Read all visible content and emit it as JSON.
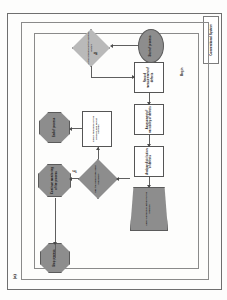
{
  "figure": {
    "caption": "(a)",
    "side_caption": "Conventional System",
    "begin_label": "Begin"
  },
  "flowchart": {
    "type": "process-flowchart",
    "orientation": "rotated-90-ccw",
    "nodes": [
      {
        "id": "start",
        "shape": "ellipse",
        "fill": "#8d8d8d",
        "label": "Start of process"
      },
      {
        "id": "decision-1",
        "shape": "diamond",
        "fill": "#b9b9b9",
        "label": "Is the process within control limits?"
      },
      {
        "id": "step-1",
        "shape": "rectangle",
        "fill": "#ffffff",
        "label": "Record measurement of defects"
      },
      {
        "id": "step-2",
        "shape": "rectangle",
        "fill": "#ffffff",
        "label": "Assessment of variability of defects"
      },
      {
        "id": "step-3",
        "shape": "rectangle",
        "fill": "#ffffff",
        "label": "Analyse distribution of defects"
      },
      {
        "id": "step-4",
        "shape": "trapezoid",
        "fill": "#8d8d8d",
        "label": "Apply corrective action to the process"
      },
      {
        "id": "decision-2",
        "shape": "diamond",
        "fill": "#8d8d8d",
        "label": "Has the defect rate been reduced?"
      },
      {
        "id": "note",
        "shape": "rectangle",
        "fill": "#ffffff",
        "label": "Check tolerance of the process and adjust settings"
      },
      {
        "id": "end-1",
        "shape": "octagon",
        "fill": "#8d8d8d",
        "label": "End of process"
      },
      {
        "id": "end-2",
        "shape": "octagon",
        "fill": "#8d8d8d",
        "label": "Continue monitoring of the process"
      },
      {
        "id": "end-3",
        "shape": "octagon",
        "fill": "#8d8d8d",
        "label": "Stop process"
      }
    ],
    "edge_labels": [
      {
        "id": "edge-yes",
        "label": "Yes"
      },
      {
        "id": "edge-no",
        "label": "No"
      }
    ]
  }
}
